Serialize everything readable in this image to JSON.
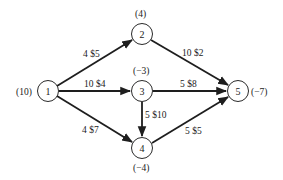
{
  "diagram": {
    "type": "network-flow",
    "nodes": [
      {
        "id": "1",
        "label": "1",
        "supply": "(10)"
      },
      {
        "id": "2",
        "label": "2",
        "supply": "(4)"
      },
      {
        "id": "3",
        "label": "3",
        "supply": "(−3)"
      },
      {
        "id": "4",
        "label": "4",
        "supply": "(−4)"
      },
      {
        "id": "5",
        "label": "5",
        "supply": "(−7)"
      }
    ],
    "edges": [
      {
        "from": "1",
        "to": "2",
        "label": "4 $5",
        "capacity": 4,
        "cost": "$5"
      },
      {
        "from": "1",
        "to": "3",
        "label": "10 $4",
        "capacity": 10,
        "cost": "$4"
      },
      {
        "from": "1",
        "to": "4",
        "label": "4 $7",
        "capacity": 4,
        "cost": "$7"
      },
      {
        "from": "2",
        "to": "5",
        "label": "10 $2",
        "capacity": 10,
        "cost": "$2"
      },
      {
        "from": "3",
        "to": "5",
        "label": "5 $8",
        "capacity": 5,
        "cost": "$8"
      },
      {
        "from": "3",
        "to": "4",
        "label": "5 $10",
        "capacity": 5,
        "cost": "$10"
      },
      {
        "from": "4",
        "to": "5",
        "label": "5 $5",
        "capacity": 5,
        "cost": "$5"
      }
    ],
    "colors": {
      "stroke": "#1e1e1e",
      "text": "#222222",
      "background": "#ffffff"
    }
  }
}
